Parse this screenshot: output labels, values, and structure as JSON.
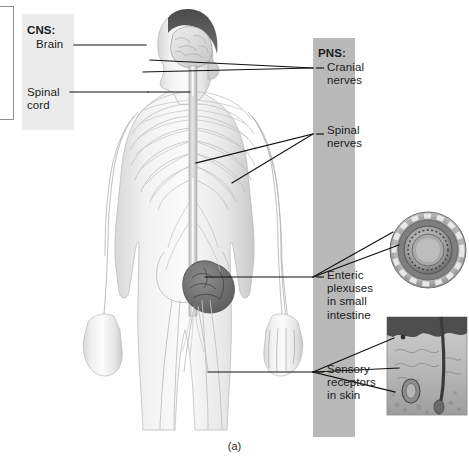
{
  "figure": {
    "caption": "(a)",
    "title_cns": "CNS:",
    "title_pns": "PNS:"
  },
  "cns_labels": [
    {
      "id": "brain",
      "text": "Brain"
    },
    {
      "id": "spinal-cord",
      "text": "Spinal\ncord"
    }
  ],
  "pns_labels": [
    {
      "id": "cranial-nerves",
      "text": "Cranial\nnerves"
    },
    {
      "id": "spinal-nerves",
      "text": "Spinal\nnerves"
    },
    {
      "id": "enteric-plexuses",
      "text": "Enteric\nplexuses\nin small\nintestine"
    },
    {
      "id": "sensory-receptors",
      "text": "Sensory\nreceptors\nin skin"
    }
  ],
  "insets": [
    {
      "id": "small-intestine-cross-section",
      "name": "intestine-cross-section-image"
    },
    {
      "id": "skin-cross-section",
      "name": "skin-cross-section-image"
    }
  ],
  "main_illustration": {
    "name": "human-body-nervous-system-illustration",
    "description": "Anterior view of human body showing brain, spinal cord, spinal nerves, and peripheral nerve branches"
  },
  "colors": {
    "cns_band": "#ebebeb",
    "pns_band": "#b9b9b9",
    "leader_line": "#111111",
    "text": "#1b1b1b",
    "background": "#ffffff"
  }
}
